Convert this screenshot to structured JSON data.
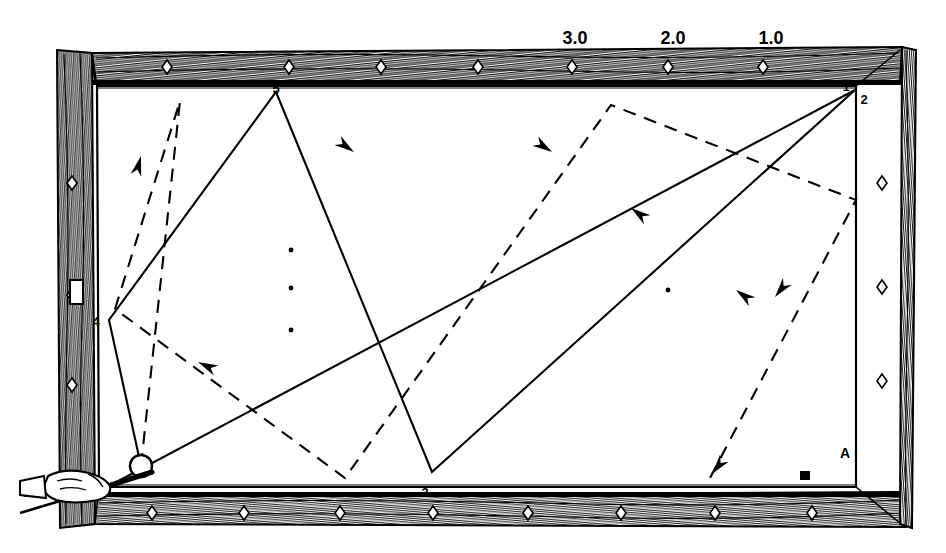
{
  "figure": {
    "background_color": "#ffffff",
    "ink_color": "#000000"
  },
  "scale_labels": [
    {
      "text": "3.0",
      "x": 575,
      "y": 44
    },
    {
      "text": "2.0",
      "x": 673,
      "y": 44
    },
    {
      "text": "1.0",
      "x": 771,
      "y": 44
    }
  ],
  "rail_numbers": [
    {
      "text": "5",
      "x": 276,
      "y": 91,
      "rail": "top"
    },
    {
      "text": "1",
      "x": 846,
      "y": 89,
      "rail": "top-right"
    },
    {
      "text": "2",
      "x": 864,
      "y": 101,
      "rail": "right-upper"
    },
    {
      "text": "3",
      "x": 425,
      "y": 497,
      "rail": "bottom"
    },
    {
      "text": "4",
      "x": 96,
      "y": 322,
      "rail": "left"
    }
  ],
  "corner_labels": [
    {
      "text": "A",
      "x": 849,
      "y": 453,
      "kind": "object-ball-a"
    },
    {
      "text": "■",
      "x": 805,
      "y": 478,
      "kind": "object-ball-b"
    }
  ],
  "cue": {
    "ball_label": "cue-ball",
    "ball_cx": 141,
    "ball_cy": 466,
    "ball_r": 11,
    "stick_tip_x": 152,
    "stick_tip_y": 472
  },
  "table_spots": [
    {
      "x": 291,
      "y": 250
    },
    {
      "x": 291,
      "y": 288
    },
    {
      "x": 291,
      "y": 330
    },
    {
      "x": 668,
      "y": 290
    }
  ],
  "rail_diamonds": {
    "top_y": 67,
    "bottom_y": 513,
    "left_x": 72,
    "right_x": 882,
    "top_xs": [
      167,
      289,
      381,
      478,
      572,
      668,
      763
    ],
    "bottom_xs": [
      152,
      244,
      340,
      433,
      528,
      621,
      715,
      812
    ],
    "left_ys": [
      183,
      295,
      385
    ],
    "right_ys": [
      183,
      287,
      381
    ]
  },
  "playing_surface": {
    "left": 97,
    "top": 86,
    "right": 855,
    "bottom": 486
  },
  "paths": {
    "solid": {
      "style": "solid",
      "description": "Actual cue-ball path with direction arrows",
      "points": [
        [
          141,
          466
        ],
        [
          109,
          320
        ],
        [
          276,
          92
        ],
        [
          432,
          472
        ],
        [
          855,
          90
        ],
        [
          107,
          487
        ]
      ],
      "arrows": [
        {
          "x": 354,
          "y": 152,
          "angle": 35
        },
        {
          "x": 198,
          "y": 362,
          "angle": 205
        },
        {
          "x": 631,
          "y": 208,
          "angle": 216
        },
        {
          "x": 736,
          "y": 290,
          "angle": 216
        }
      ]
    },
    "dashed": {
      "style": "dashed",
      "description": "Reference / ghost path showing the mirrored bank lines",
      "points": [
        [
          141,
          466
        ],
        [
          180,
          101
        ],
        [
          115,
          309
        ],
        [
          345,
          478
        ],
        [
          611,
          105
        ],
        [
          856,
          200
        ],
        [
          710,
          478
        ]
      ],
      "arrows": [
        {
          "x": 141,
          "y": 156,
          "angle": 285
        },
        {
          "x": 552,
          "y": 152,
          "angle": 33
        },
        {
          "x": 775,
          "y": 297,
          "angle": 128
        },
        {
          "x": 712,
          "y": 474,
          "angle": 128
        }
      ]
    }
  },
  "wood_rail": {
    "grain_color": "#151515",
    "fill_color": "#ffffff",
    "outer": {
      "left": 55,
      "top": 50,
      "right": 916,
      "bottom": 528
    }
  }
}
